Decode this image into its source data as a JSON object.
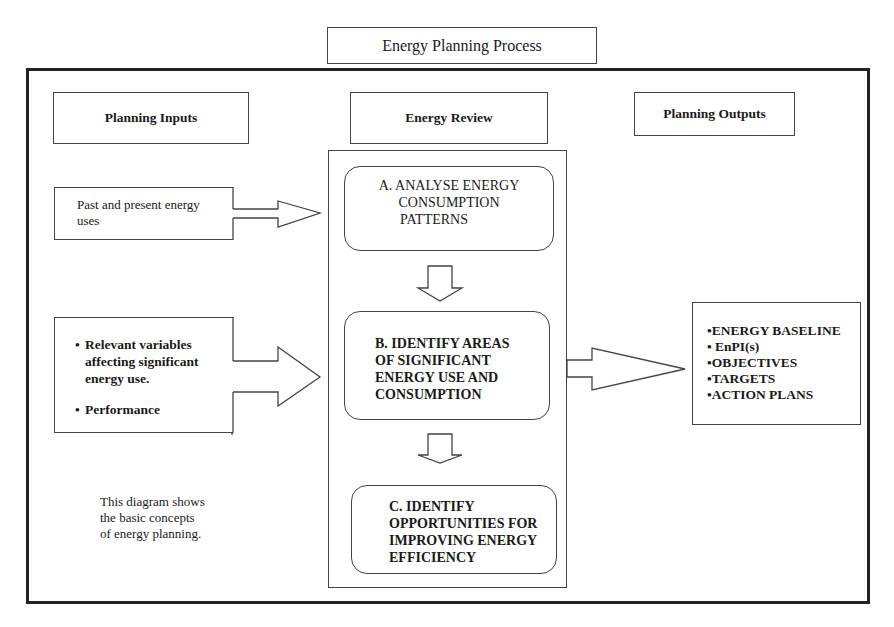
{
  "title": "Energy Planning Process",
  "columns": {
    "inputs_header": "Planning Inputs",
    "review_header": "Energy Review",
    "outputs_header": "Planning Outputs"
  },
  "inputs": [
    {
      "lines": [
        "Past and  present energy",
        "uses"
      ]
    },
    {
      "bullets": [
        "Relevant variables affecting significant energy use.",
        "Performance"
      ]
    }
  ],
  "review_steps": [
    {
      "label": "A. ANALYSE ENERGY CONSUMPTION PATTERNS",
      "lines": [
        "A. ANALYSE ENERGY",
        "CONSUMPTION",
        "PATTERNS"
      ]
    },
    {
      "label": "B. IDENTIFY AREAS OF SIGNIFICANT ENERGY USE AND CONSUMPTION",
      "lines": [
        "B. IDENTIFY AREAS",
        "OF SIGNIFICANT",
        "ENERGY USE AND",
        "CONSUMPTION"
      ]
    },
    {
      "label": "C. IDENTIFY OPPORTUNITIES FOR IMPROVING ENERGY EFFICIENCY",
      "lines": [
        "C. IDENTIFY",
        "OPPORTUNITIES FOR",
        "IMPROVING ENERGY",
        "EFFICIENCY"
      ]
    }
  ],
  "outputs": [
    "•ENERGY BASELINE",
    "• EnPI(s)",
    "•OBJECTIVES",
    "•TARGETS",
    "•ACTION PLANS"
  ],
  "caption": [
    "This diagram shows",
    "the basic concepts",
    "of energy planning."
  ],
  "colors": {
    "line": "#444444",
    "frame": "#222222",
    "text": "#1a1a1a",
    "background": "#ffffff"
  }
}
